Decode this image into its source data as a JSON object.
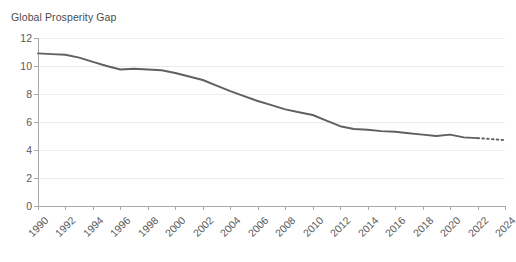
{
  "chart_data": {
    "type": "line",
    "title": "Global Prosperity Gap",
    "subtitle": "",
    "xlabel": "",
    "ylabel": "",
    "xlim": [
      1990,
      2024
    ],
    "ylim": [
      0,
      12
    ],
    "grid": true,
    "legend": false,
    "legend_position": "none",
    "y_ticks": [
      0,
      2,
      4,
      6,
      8,
      10,
      12
    ],
    "y_tick_labels": [
      "0",
      "2",
      "4",
      "6",
      "8",
      "10",
      "12"
    ],
    "x_ticks": [
      1990,
      1992,
      1994,
      1996,
      1998,
      2000,
      2002,
      2004,
      2006,
      2008,
      2010,
      2012,
      2014,
      2016,
      2018,
      2020,
      2022,
      2024
    ],
    "x_tick_labels": [
      "1990",
      "1992",
      "1994",
      "1996",
      "1998",
      "2000",
      "2002",
      "2004",
      "2006",
      "2008",
      "2010",
      "2012",
      "2014",
      "2016",
      "2018",
      "2020",
      "2022",
      "2024"
    ],
    "series": [
      {
        "name": "Global Prosperity Gap",
        "style": "solid",
        "color": "#5f6063",
        "x": [
          1990,
          1991,
          1992,
          1993,
          1994,
          1995,
          1996,
          1997,
          1998,
          1999,
          2000,
          2001,
          2002,
          2003,
          2004,
          2005,
          2006,
          2007,
          2008,
          2009,
          2010,
          2011,
          2012,
          2013,
          2014,
          2015,
          2016,
          2017,
          2018,
          2019,
          2020,
          2021,
          2022
        ],
        "values": [
          10.9,
          10.85,
          10.8,
          10.6,
          10.3,
          10.0,
          9.75,
          9.8,
          9.75,
          9.7,
          9.5,
          9.25,
          9.0,
          8.6,
          8.2,
          7.85,
          7.5,
          7.2,
          6.9,
          6.7,
          6.5,
          6.1,
          5.7,
          5.5,
          5.45,
          5.35,
          5.3,
          5.2,
          5.1,
          5.0,
          5.1,
          4.9,
          4.85
        ]
      },
      {
        "name": "Global Prosperity Gap (projection)",
        "style": "dotted",
        "color": "#5f6063",
        "x": [
          2022,
          2023,
          2024
        ],
        "values": [
          4.85,
          4.78,
          4.7
        ]
      }
    ],
    "annotations": []
  }
}
